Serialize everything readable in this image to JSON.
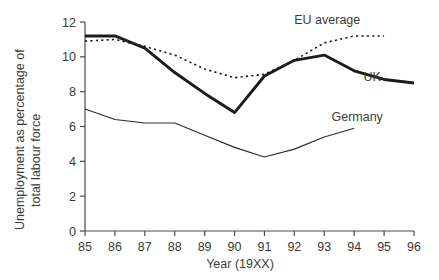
{
  "chart_data": {
    "type": "line",
    "title": "",
    "xlabel": "Year (19XX)",
    "ylabel": "Unemployment as percentage of total labour force",
    "ylabel_line1": "Unemployment as percentage of",
    "ylabel_line2": "total labour force",
    "xlim": [
      85,
      96
    ],
    "ylim": [
      0,
      12
    ],
    "ytick_step": 2,
    "grid": false,
    "legend_position": "inline-annotations",
    "x": [
      85,
      86,
      87,
      88,
      89,
      90,
      91,
      92,
      93,
      94,
      95,
      96
    ],
    "xtick_labels": [
      "85",
      "86",
      "87",
      "88",
      "89",
      "90",
      "91",
      "92",
      "93",
      "94",
      "95",
      "96"
    ],
    "ytick_labels": [
      "0",
      "2",
      "4",
      "6",
      "8",
      "10",
      "12"
    ],
    "series": [
      {
        "name": "UK",
        "label": "UK",
        "style": "thick-solid",
        "color": "#1c1c1c",
        "x": [
          85,
          86,
          87,
          88,
          89,
          90,
          91,
          92,
          93,
          94,
          95,
          96
        ],
        "values": [
          11.2,
          11.2,
          10.5,
          9.1,
          7.9,
          6.8,
          8.9,
          9.8,
          10.1,
          9.2,
          8.7,
          8.5
        ]
      },
      {
        "name": "EU average",
        "label": "EU average",
        "style": "dotted",
        "color": "#1c1c1c",
        "x": [
          85,
          86,
          87,
          88,
          89,
          90,
          91,
          92,
          93,
          94,
          95
        ],
        "values": [
          10.9,
          11.0,
          10.6,
          10.1,
          9.3,
          8.8,
          9.0,
          9.8,
          10.8,
          11.2,
          11.2
        ]
      },
      {
        "name": "Germany",
        "label": "Germany",
        "style": "thin-solid",
        "color": "#2b2b2b",
        "x": [
          85,
          86,
          87,
          88,
          89,
          90,
          91,
          92,
          93,
          94
        ],
        "values": [
          7.0,
          6.4,
          6.2,
          6.2,
          5.5,
          4.8,
          4.25,
          4.7,
          5.4,
          5.9
        ]
      }
    ],
    "annotations": [
      {
        "name": "eu-average-label",
        "text": "EU average",
        "x": 93.1,
        "y": 11.9,
        "anchor": "middle"
      },
      {
        "name": "uk-label",
        "text": "UK",
        "x": 94.6,
        "y": 8.6,
        "anchor": "middle"
      },
      {
        "name": "germany-label",
        "text": "Germany",
        "x": 94.1,
        "y": 6.3,
        "anchor": "middle"
      }
    ]
  }
}
